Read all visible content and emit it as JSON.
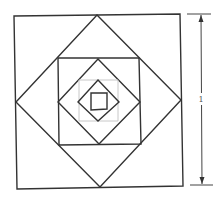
{
  "diagram": {
    "title": "",
    "colors": {
      "line": "#333333",
      "faint_line": "#c8c8c8",
      "background": "#ffffff"
    },
    "shapes": [
      {
        "name": "outer-square",
        "kind": "square",
        "level": 1
      },
      {
        "name": "large-diamond",
        "kind": "diamond",
        "level": 2
      },
      {
        "name": "middle-square",
        "kind": "square",
        "level": 3
      },
      {
        "name": "middle-diamond",
        "kind": "diamond",
        "level": 4
      },
      {
        "name": "faint-square",
        "kind": "square",
        "level": 5,
        "faint": true
      },
      {
        "name": "small-diamond",
        "kind": "diamond",
        "level": 6
      },
      {
        "name": "inner-square",
        "kind": "square",
        "level": 7
      }
    ],
    "dimension": {
      "label": "1",
      "measures": "side length of outer square"
    }
  }
}
